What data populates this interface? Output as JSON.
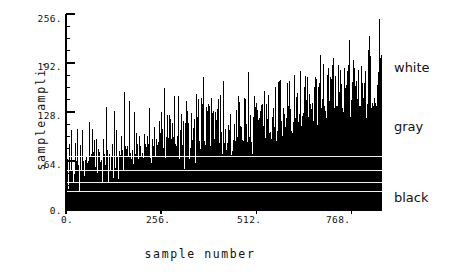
{
  "chart_data": {
    "type": "line",
    "title": "",
    "subtitle": "",
    "xlabel": "sample number",
    "ylabel": "sample ampli.",
    "xlim": [
      0,
      850
    ],
    "ylim": [
      0,
      256
    ],
    "xticks": [
      0,
      256,
      512,
      768
    ],
    "xtick_labels": [
      "0.",
      "256.",
      "512.",
      "768."
    ],
    "yticks": [
      0,
      64,
      128,
      192,
      256
    ],
    "ytick_labels": [
      "0.",
      "64.",
      "128.",
      "192.",
      "256."
    ],
    "y_minor_tick_step": 16,
    "grid": false,
    "legend": "none",
    "series_color": "#000000",
    "annotations": [
      {
        "label": "white",
        "value": 192,
        "position": "right-of-axes"
      },
      {
        "label": "gray",
        "value": 118,
        "position": "right-of-axes"
      },
      {
        "label": "black",
        "value": 36,
        "position": "right-of-axes"
      }
    ],
    "series": [
      {
        "name": "sample amplitude",
        "x_start": 0,
        "x_step": 1,
        "n_points": 850,
        "values": [
          18,
          42,
          26,
          9,
          55,
          31,
          12,
          74,
          38,
          20,
          61,
          28,
          14,
          48,
          96,
          35,
          22,
          67,
          30,
          11,
          58,
          44,
          18,
          82,
          36,
          25,
          70,
          33,
          15,
          52,
          88,
          40,
          19,
          63,
          29,
          13,
          76,
          41,
          23,
          59,
          34,
          17,
          90,
          46,
          27,
          68,
          32,
          10,
          54,
          85,
          38,
          21,
          66,
          31,
          16,
          79,
          43,
          24,
          57,
          36,
          20,
          94,
          48,
          28,
          71,
          33,
          12,
          60,
          87,
          39,
          22,
          64,
          30,
          18,
          77,
          45,
          26,
          69,
          35,
          14,
          83,
          50,
          29,
          72,
          34,
          19,
          58,
          100,
          42,
          23,
          65,
          31,
          17,
          80,
          47,
          27,
          74,
          37,
          15,
          62,
          92,
          44,
          25,
          70,
          32,
          20,
          108,
          49,
          30,
          73,
          36,
          13,
          66,
          97,
          41,
          24,
          68,
          33,
          18,
          86,
          52,
          28,
          75,
          38,
          16,
          64,
          120,
          46,
          26,
          71,
          34,
          21,
          89,
          55,
          31,
          78,
          40,
          17,
          67,
          105,
          48,
          29,
          72,
          35,
          14,
          83,
          58,
          33,
          80,
          43,
          22,
          69,
          130,
          51,
          30,
          76,
          37,
          19,
          88,
          60,
          34,
          82,
          45,
          24,
          71,
          112,
          53,
          32,
          78,
          39,
          16,
          90,
          62,
          36,
          85,
          47,
          26,
          73,
          118,
          55,
          33,
          80,
          41,
          20,
          93,
          64,
          38,
          87,
          49,
          28,
          75,
          100,
          57,
          35,
          82,
          43,
          18,
          95,
          66,
          40,
          89,
          51,
          30,
          77,
          125,
          59,
          37,
          84,
          45,
          22,
          98,
          68,
          42,
          91,
          53,
          32,
          79,
          110,
          61,
          39,
          86,
          47,
          24,
          71,
          70,
          44,
          93,
          55,
          34,
          81,
          136,
          63,
          41,
          88,
          49,
          26,
          102,
          72,
          46,
          95,
          57,
          36,
          83,
          115,
          65,
          43,
          90,
          51,
          28,
          105,
          74,
          48,
          97,
          59,
          38,
          85,
          128,
          67,
          45,
          92,
          53,
          30,
          108,
          76,
          50,
          99,
          61,
          40,
          87,
          119,
          69,
          47,
          94,
          55,
          32,
          111,
          78,
          52,
          101,
          63,
          42,
          89,
          132,
          71,
          49,
          96,
          57,
          34,
          114,
          80,
          54,
          103,
          65,
          44,
          91,
          122,
          73,
          51,
          98,
          59,
          36,
          117,
          82,
          56,
          105,
          67,
          46,
          93,
          140,
          75,
          53,
          100,
          61,
          38,
          120,
          84,
          58,
          107,
          69,
          48,
          95,
          126,
          77,
          55,
          102,
          63,
          40,
          123,
          86,
          60,
          109,
          71,
          50,
          97,
          134,
          79,
          57,
          104,
          65,
          42,
          126,
          88,
          62,
          111,
          73,
          52,
          99,
          116,
          81,
          59,
          106,
          67,
          44,
          129,
          90,
          64,
          113,
          75,
          54,
          101,
          143,
          83,
          61,
          108,
          69,
          46,
          132,
          92,
          66,
          115,
          77,
          56,
          103,
          124,
          85,
          63,
          110,
          71,
          48,
          135,
          94,
          68,
          117,
          79,
          58,
          105,
          137,
          87,
          65,
          112,
          73,
          50,
          118,
          96,
          70,
          119,
          81,
          60,
          107,
          128,
          89,
          67,
          114,
          75,
          52,
          121,
          98,
          72,
          100,
          83,
          62,
          109,
          139,
          91,
          69,
          116,
          77,
          54,
          124,
          85,
          74,
          102,
          85,
          64,
          111,
          130,
          93,
          71,
          118,
          79,
          56,
          127,
          87,
          76,
          104,
          87,
          66,
          113,
          121,
          95,
          73,
          120,
          81,
          58,
          110,
          89,
          78,
          106,
          89,
          68,
          115,
          133,
          97,
          75,
          122,
          83,
          60,
          113,
          91,
          80,
          108,
          91,
          70,
          117,
          125,
          99,
          77,
          124,
          85,
          62,
          116,
          93,
          82,
          110,
          93,
          72,
          119,
          142,
          101,
          79,
          126,
          87,
          64,
          119,
          95,
          84,
          112,
          95,
          74,
          121,
          127,
          103,
          81,
          128,
          89,
          66,
          122,
          97,
          86,
          114,
          97,
          76,
          123,
          118,
          105,
          83,
          130,
          91,
          68,
          125,
          99,
          88,
          116,
          99,
          78,
          125,
          136,
          107,
          85,
          132,
          93,
          70,
          128,
          101,
          90,
          118,
          101,
          80,
          127,
          129,
          109,
          87,
          134,
          95,
          72,
          131,
          103,
          92,
          120,
          103,
          82,
          129,
          122,
          111,
          89,
          136,
          97,
          74,
          134,
          105,
          94,
          122,
          105,
          84,
          131,
          138,
          113,
          91,
          138,
          99,
          76,
          137,
          107,
          96,
          124,
          107,
          86,
          133,
          124,
          115,
          93,
          140,
          101,
          78,
          140,
          109,
          98,
          126,
          109,
          88,
          135,
          131,
          117,
          95,
          142,
          103,
          80,
          143,
          111,
          100,
          128,
          111,
          90,
          137,
          126,
          119,
          97,
          144,
          105,
          82,
          146,
          113,
          102,
          130,
          113,
          92,
          139,
          133,
          121,
          99,
          146,
          107,
          84,
          149,
          115,
          104,
          132,
          115,
          94,
          141,
          128,
          123,
          101,
          148,
          109,
          86,
          152,
          117,
          106,
          134,
          117,
          96,
          143,
          135,
          125,
          103,
          150,
          111,
          88,
          155,
          119,
          108,
          136,
          119,
          98,
          145,
          130,
          127,
          105,
          152,
          113,
          90,
          158,
          121,
          110,
          138,
          121,
          100,
          147,
          137,
          129,
          107,
          154,
          115,
          92,
          161,
          123,
          112,
          140,
          123,
          102,
          149,
          132,
          131,
          109,
          156,
          117,
          94,
          164,
          125,
          114,
          142,
          125,
          104,
          151,
          139,
          133,
          111,
          158,
          119,
          96,
          167,
          127,
          116,
          144,
          127,
          106,
          153,
          134,
          135,
          113,
          160,
          121,
          98,
          170,
          129,
          118,
          146,
          129,
          108,
          155,
          141,
          137,
          115,
          162,
          123,
          100,
          173,
          131,
          120,
          148,
          131,
          110,
          157,
          136,
          139,
          117,
          164,
          125,
          102,
          176,
          133,
          122,
          150,
          133,
          112,
          159,
          143,
          141,
          119,
          166,
          127,
          104,
          179,
          135,
          124,
          152,
          135,
          114,
          161,
          138,
          143,
          121,
          168,
          129,
          106,
          182,
          137,
          126,
          154,
          137,
          116,
          163,
          145,
          145,
          123,
          170,
          131,
          108,
          185,
          139,
          128,
          156,
          139,
          118,
          165,
          140,
          147,
          125,
          172,
          133,
          110,
          188,
          141,
          130,
          158,
          141,
          120,
          167,
          147,
          149,
          127,
          174,
          135,
          112,
          191,
          143,
          132,
          160,
          143,
          122,
          169,
          142,
          151,
          129,
          176,
          137,
          114,
          194,
          145,
          134,
          162,
          145,
          124,
          171,
          149,
          153,
          131,
          178,
          139,
          116,
          197,
          147,
          136,
          164,
          147,
          126,
          173
        ],
        "note": "dense single-pixel vertical spike trace, 850 samples, amplitude 0-150"
      }
    ]
  }
}
